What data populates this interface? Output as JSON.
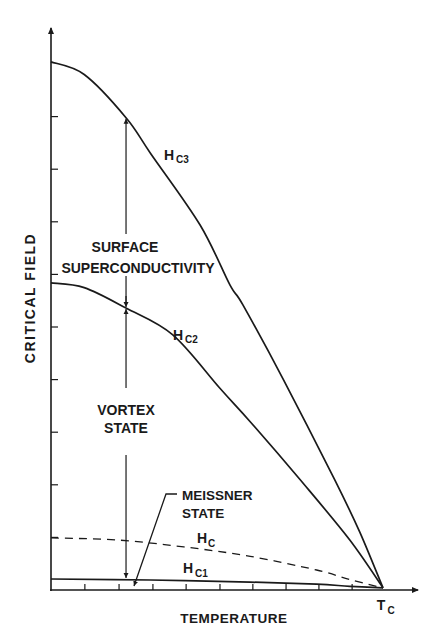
{
  "chart_data": {
    "type": "line",
    "title": "",
    "xlabel": "TEMPERATURE",
    "ylabel": "CRITICAL FIELD",
    "x_tick_labels": [
      "T",
      "C"
    ],
    "tc_label": {
      "main": "T",
      "sub": "C"
    },
    "xlim": [
      0,
      1.1
    ],
    "ylim": [
      0,
      10.6
    ],
    "x_minor_ticks": [
      0.102,
      0.205,
      0.307,
      0.407,
      0.509,
      0.608,
      0.708,
      0.807,
      0.907
    ],
    "y_minor_ticks": [
      1,
      2,
      3,
      4,
      5,
      6,
      7,
      8,
      9
    ],
    "grid": false,
    "series": [
      {
        "name": "Hc3",
        "label_main": "H",
        "label_sub": "C3",
        "style": "solid",
        "x": [
          0,
          0.1,
          0.226,
          0.3,
          0.449,
          0.539,
          0.578,
          0.7,
          0.855,
          0.93,
          1.0
        ],
        "y": [
          10.04,
          9.8,
          8.98,
          8.3,
          6.94,
          5.8,
          5.42,
          4.0,
          2.09,
          1.1,
          0.04
        ]
      },
      {
        "name": "Hc2",
        "label_main": "H",
        "label_sub": "C2",
        "style": "solid",
        "x": [
          0,
          0.1,
          0.226,
          0.367,
          0.508,
          0.6,
          0.75,
          0.9,
          1.0
        ],
        "y": [
          5.84,
          5.75,
          5.36,
          4.85,
          3.84,
          3.2,
          2.1,
          0.95,
          0.04
        ]
      },
      {
        "name": "Hc",
        "label_main": "H",
        "label_sub": "C",
        "style": "dashed",
        "x": [
          0,
          0.2,
          0.4,
          0.6,
          0.8,
          0.9,
          1.0
        ],
        "y": [
          0.99,
          0.95,
          0.82,
          0.64,
          0.38,
          0.2,
          0.04
        ]
      },
      {
        "name": "Hc1",
        "label_main": "H",
        "label_sub": "C1",
        "style": "solid",
        "x": [
          0,
          0.3,
          0.6,
          0.8,
          0.9,
          1.0
        ],
        "y": [
          0.21,
          0.19,
          0.15,
          0.11,
          0.07,
          0.04
        ]
      }
    ],
    "annotations": [
      {
        "text_lines": [
          "SURFACE",
          "SUPERCONDUCTIVITY"
        ],
        "region": "between Hc2 and Hc3"
      },
      {
        "text_lines": [
          "VORTEX",
          "STATE"
        ],
        "region": "between Hc1 and Hc2"
      },
      {
        "text_lines": [
          "MEISSNER",
          "STATE"
        ],
        "region": "below Hc1",
        "leader": true
      }
    ],
    "range_arrow": {
      "x": 0.226,
      "from_y": 0.21,
      "via_y": 5.36,
      "to_y": 8.98
    }
  }
}
